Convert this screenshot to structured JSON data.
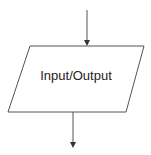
{
  "diagram": {
    "shape": "parallelogram",
    "label": "Input/Output",
    "stroke_color": "#555555",
    "fill_color": "#ffffff",
    "incoming_arrow": "top",
    "outgoing_arrow": "bottom"
  }
}
